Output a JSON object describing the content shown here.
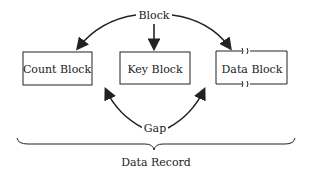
{
  "diagram": {
    "top_label": "Block",
    "boxes": [
      {
        "label": "Count Block"
      },
      {
        "label": "Key Block"
      },
      {
        "label": "Data Block"
      }
    ],
    "gap_label": "Gap",
    "brace_label": "Data Record"
  }
}
